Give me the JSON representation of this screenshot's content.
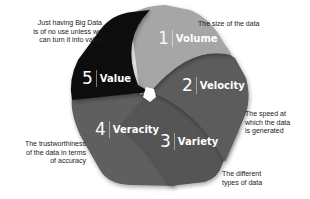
{
  "diagram": {
    "segments": [
      {
        "number": "1",
        "label": "Volume",
        "description": "The size of the data",
        "color": "#a6a6a6"
      },
      {
        "number": "2",
        "label": "Velocity",
        "description": "The speed at which the data is generated",
        "color": "#5b5b5b"
      },
      {
        "number": "3",
        "label": "Variety",
        "description": "The different types of data",
        "color": "#545454"
      },
      {
        "number": "4",
        "label": "Veracity",
        "description": "The trustworthiness of the data in terms of accuracy",
        "color": "#5f5f5f"
      },
      {
        "number": "5",
        "label": "Value",
        "description": "Just having Big Data is of no use unless we can turn it into value",
        "color": "#0d0d0d"
      }
    ],
    "notes": {
      "value": [
        "Just having Big Data",
        "is of no use unless we",
        "can turn it into value"
      ],
      "volume": [
        "The size of the data"
      ],
      "velocity": [
        "The speed at",
        "which the data",
        "is generated"
      ],
      "veracity": [
        "The trustworthiness",
        "of the data in terms",
        "of accuracy"
      ],
      "variety": [
        "The different",
        "types of data"
      ]
    }
  }
}
